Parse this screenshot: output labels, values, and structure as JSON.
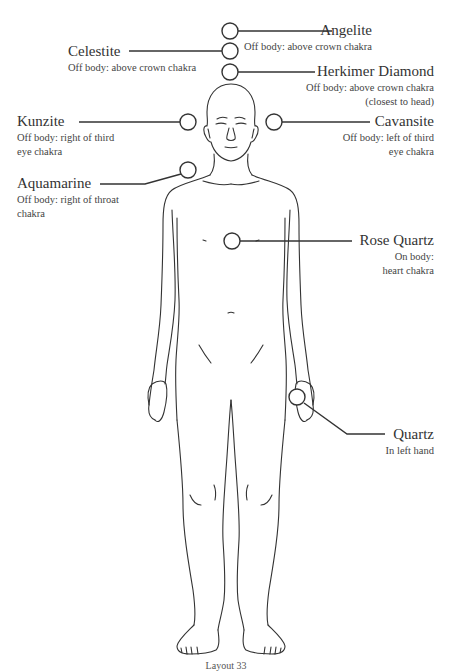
{
  "diagram": {
    "type": "crystal-placement-body-layout",
    "figure": "front-view human outline",
    "stones": [
      {
        "name": "Angelite",
        "description": [
          "Off body: above crown chakra"
        ],
        "side": "right",
        "marker": {
          "cx": 230,
          "cy": 31
        }
      },
      {
        "name": "Celestite",
        "description": [
          "Off body: above crown chakra"
        ],
        "side": "left",
        "marker": {
          "cx": 230,
          "cy": 51
        }
      },
      {
        "name": "Herkimer Diamond",
        "description": [
          "Off body: above crown chakra",
          "(closest to head)"
        ],
        "side": "right",
        "marker": {
          "cx": 230,
          "cy": 72
        }
      },
      {
        "name": "Kunzite",
        "description": [
          "Off body: right of third",
          "eye chakra"
        ],
        "side": "left",
        "marker": {
          "cx": 188,
          "cy": 122
        }
      },
      {
        "name": "Cavansite",
        "description": [
          "Off body: left of third",
          "eye chakra"
        ],
        "side": "right",
        "marker": {
          "cx": 274,
          "cy": 122
        }
      },
      {
        "name": "Aquamarine",
        "description": [
          "Off body: right of throat",
          "chakra"
        ],
        "side": "left",
        "marker": {
          "cx": 188,
          "cy": 170
        }
      },
      {
        "name": "Rose Quartz",
        "description": [
          "On body:",
          "heart chakra"
        ],
        "side": "right",
        "marker": {
          "cx": 232,
          "cy": 241
        }
      },
      {
        "name": "Quartz",
        "description": [
          "In left hand"
        ],
        "side": "right",
        "marker": {
          "cx": 297,
          "cy": 397
        }
      }
    ],
    "caption": "Layout 33"
  },
  "colors": {
    "line": "#333333",
    "text": "#333333",
    "background": "#ffffff"
  }
}
